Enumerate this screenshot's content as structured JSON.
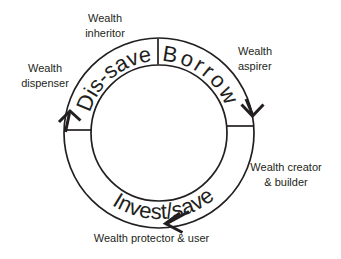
{
  "colors": {
    "ink": "#231f20",
    "background": "#ffffff"
  },
  "cycle": {
    "flow_direction": "clockwise",
    "segments": [
      {
        "label": "Dis-save",
        "position": "top-left"
      },
      {
        "label": "Borrow",
        "position": "top-right"
      },
      {
        "label": "Invest/save",
        "position": "bottom"
      }
    ]
  },
  "outer_labels": {
    "inheritor": {
      "line1": "Wealth",
      "line2": "inheritor"
    },
    "aspirer": {
      "line1": "Wealth",
      "line2": "aspirer"
    },
    "creator": {
      "line1": "Wealth creator",
      "line2": "& builder"
    },
    "protector": {
      "line1": "Wealth protector & user"
    },
    "dispenser": {
      "line1": "Wealth",
      "line2": "dispenser"
    }
  }
}
